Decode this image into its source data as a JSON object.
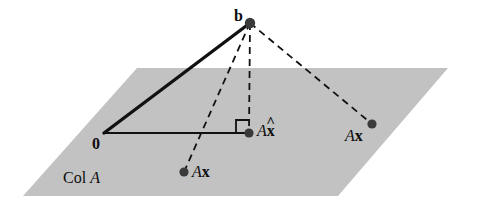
{
  "figure": {
    "type": "geometry-diagram",
    "width": 477,
    "height": 203,
    "background_color": "#ffffff",
    "plane_fill_color": "#c0c0c0",
    "line_color": "#111111"
  },
  "labels": {
    "b": "b",
    "origin": "0",
    "a_x_hat_A": "A",
    "a_x_hat_x": "x",
    "a_x_hat_accent": "^",
    "ax_lower_A": "A",
    "ax_lower_x": "x",
    "ax_right_A": "A",
    "ax_right_x": "x",
    "col_a_col": "Col ",
    "col_a_A": "A"
  },
  "points": [
    {
      "name": "b",
      "x": 250,
      "y": 23,
      "label": "b",
      "radius": 5
    },
    {
      "name": "origin",
      "x": 104,
      "y": 133,
      "label": "0",
      "radius": 0
    },
    {
      "name": "a-x-hat",
      "x": 249,
      "y": 133,
      "label": "Ax̂",
      "radius": 4.5
    },
    {
      "name": "ax-lower",
      "x": 184,
      "y": 172,
      "label": "Ax",
      "radius": 4.5
    },
    {
      "name": "ax-right",
      "x": 372,
      "y": 124,
      "label": "Ax",
      "radius": 4.5
    }
  ],
  "plane": {
    "name": "col-a-plane",
    "vertices": [
      [
        137,
        68
      ],
      [
        448,
        68
      ],
      [
        338,
        196
      ],
      [
        23,
        196
      ]
    ]
  },
  "segments": [
    {
      "name": "origin-to-b",
      "from": [
        104,
        133
      ],
      "to": [
        250,
        23
      ],
      "style": "solid",
      "width": 3.2
    },
    {
      "name": "origin-to-a-x-hat",
      "from": [
        104,
        133
      ],
      "to": [
        249,
        133
      ],
      "style": "solid",
      "width": 1.8
    },
    {
      "name": "b-to-a-x-hat",
      "from": [
        250,
        23
      ],
      "to": [
        249,
        133
      ],
      "style": "dashed",
      "width": 1.8
    },
    {
      "name": "b-to-ax-lower",
      "from": [
        250,
        23
      ],
      "to": [
        184,
        172
      ],
      "style": "dashed",
      "width": 1.8
    },
    {
      "name": "b-to-ax-right",
      "from": [
        250,
        23
      ],
      "to": [
        372,
        124
      ],
      "style": "dashed",
      "width": 1.8
    }
  ],
  "right_angle_marker": {
    "name": "right-angle-marker",
    "corner": [
      249,
      133
    ],
    "size": 13
  }
}
